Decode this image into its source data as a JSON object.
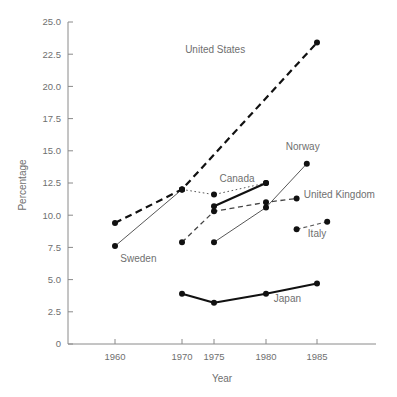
{
  "chart_data": {
    "type": "line",
    "title": "",
    "xlabel": "Year",
    "ylabel": "Percentage",
    "grid": false,
    "legend_position": "inline-labels",
    "x_ticks": [
      "1960",
      "1970",
      "1975",
      "1980",
      "1985"
    ],
    "x_tick_values": [
      1960,
      1970,
      1975,
      1980,
      1985
    ],
    "xlim": [
      1956,
      1988
    ],
    "y_ticks": [
      "0",
      "2.5",
      "5.0",
      "7.5",
      "10.0",
      "12.5",
      "15.0",
      "17.5",
      "20.0",
      "22.5",
      "25.0"
    ],
    "y_tick_values": [
      0,
      2.5,
      5.0,
      7.5,
      10.0,
      12.5,
      15.0,
      17.5,
      20.0,
      22.5,
      25.0
    ],
    "ylim": [
      0,
      25
    ],
    "series": [
      {
        "name": "United States",
        "label": "United States",
        "style": "thick-dashed",
        "x": [
          1960,
          1970,
          1985
        ],
        "values": [
          9.4,
          12.0,
          23.4
        ]
      },
      {
        "name": "Sweden",
        "label": "Sweden",
        "style": "thin-solid",
        "x": [
          1960,
          1970
        ],
        "values": [
          7.6,
          12.0
        ]
      },
      {
        "name": "Sweden-dotted",
        "label": "",
        "style": "dotted",
        "x": [
          1970,
          1975,
          1980
        ],
        "values": [
          12.0,
          11.6,
          12.5
        ]
      },
      {
        "name": "Canada",
        "label": "Canada",
        "style": "thick-solid",
        "x": [
          1975,
          1980
        ],
        "values": [
          10.7,
          12.5
        ]
      },
      {
        "name": "United Kingdom",
        "label": "United Kingdom",
        "style": "dashed",
        "x": [
          1970,
          1975,
          1980,
          1983
        ],
        "values": [
          7.9,
          10.3,
          11.0,
          11.3
        ]
      },
      {
        "name": "Norway",
        "label": "Norway",
        "style": "thin-solid-rising",
        "x": [
          1975,
          1980,
          1984
        ],
        "values": [
          7.9,
          10.6,
          14.0
        ]
      },
      {
        "name": "Italy",
        "label": "Italy",
        "style": "dashed-short",
        "x": [
          1983,
          1986
        ],
        "values": [
          8.9,
          9.5
        ]
      },
      {
        "name": "Japan",
        "label": "Japan",
        "style": "thick-solid",
        "x": [
          1970,
          1975,
          1980,
          1985
        ],
        "values": [
          3.9,
          3.2,
          3.9,
          4.7
        ]
      }
    ],
    "annotations": [
      {
        "text": "United States",
        "x": 1978.0,
        "y": 22.6,
        "anchor": "end"
      },
      {
        "text": "Sweden",
        "x": 1960.8,
        "y": 6.4,
        "anchor": "start"
      },
      {
        "text": "Canada",
        "x": 1978.9,
        "y": 12.6,
        "anchor": "end"
      },
      {
        "text": "Norway",
        "x": 1983.6,
        "y": 15.1,
        "anchor": "middle"
      },
      {
        "text": "United Kingdom",
        "x": 1983.7,
        "y": 11.3,
        "anchor": "start"
      },
      {
        "text": "Italy",
        "x": 1985.0,
        "y": 8.3,
        "anchor": "middle"
      },
      {
        "text": "Japan",
        "x": 1982.1,
        "y": 3.3,
        "anchor": "middle"
      }
    ]
  },
  "axes": {
    "y_title": "Percentage",
    "x_title": "Year"
  }
}
